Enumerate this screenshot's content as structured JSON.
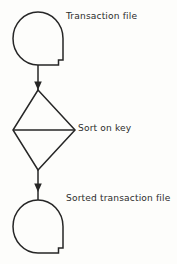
{
  "diagram": {
    "type": "flowchart",
    "orientation": "vertical",
    "background_color": "#fdfdfb",
    "stroke_color": "#262626",
    "stroke_width": 1.5,
    "nodes": [
      {
        "id": "transaction-file",
        "shape": "magnetic-tape",
        "label": "Transaction file",
        "label_position": "right"
      },
      {
        "id": "sort-on-key",
        "shape": "sort-diamond",
        "label": "Sort on key",
        "label_position": "right"
      },
      {
        "id": "sorted-transaction-file",
        "shape": "magnetic-tape",
        "label": "Sorted transaction file",
        "label_position": "right"
      }
    ],
    "connectors": [
      {
        "id": "tape-to-sort",
        "from": "transaction-file",
        "to": "sort-on-key",
        "arrow": "down"
      },
      {
        "id": "sort-to-tape",
        "from": "sort-on-key",
        "to": "sorted-transaction-file",
        "arrow": "down"
      }
    ]
  }
}
